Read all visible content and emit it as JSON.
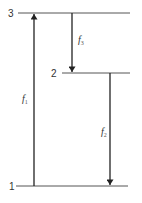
{
  "diagram": {
    "type": "energy-level-diagram",
    "colors": {
      "line": "#555555",
      "arrow": "#222222",
      "text": "#333333"
    },
    "levels": [
      {
        "id": "3",
        "label": "3",
        "y": 13,
        "x1": 18,
        "x2": 130,
        "label_x": 9
      },
      {
        "id": "2",
        "label": "2",
        "y": 73,
        "x1": 62,
        "x2": 130,
        "label_x": 52
      },
      {
        "id": "1",
        "label": "1",
        "y": 186,
        "x1": 16,
        "x2": 128,
        "label_x": 11
      }
    ],
    "transitions": [
      {
        "id": "f1",
        "label": "f",
        "subscript": "1",
        "from": "1",
        "to": "3",
        "direction": "up",
        "x": 34,
        "label_x": 22,
        "label_y": 100
      },
      {
        "id": "f3",
        "label": "f",
        "subscript": "3",
        "from": "3",
        "to": "2",
        "direction": "down",
        "x": 72,
        "label_x": 78,
        "label_y": 42
      },
      {
        "id": "f2",
        "label": "f",
        "subscript": "2",
        "from": "2",
        "to": "1",
        "direction": "down",
        "x": 110,
        "label_x": 102,
        "label_y": 134
      }
    ]
  }
}
